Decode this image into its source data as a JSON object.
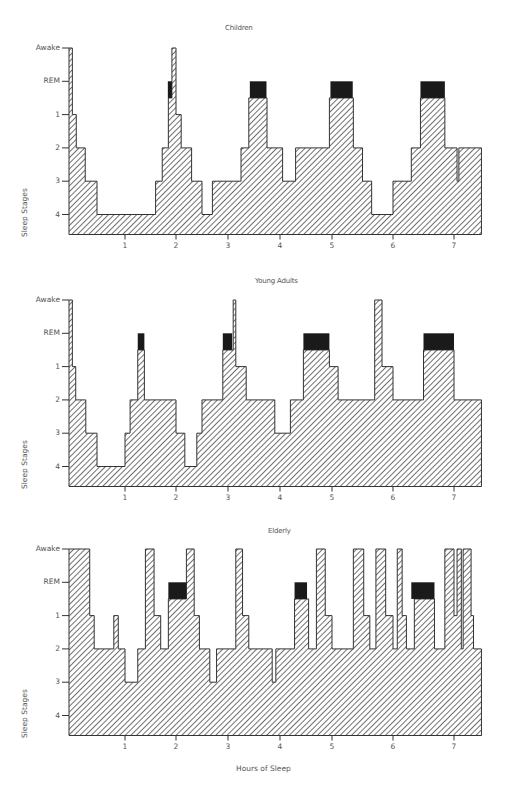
{
  "figure": {
    "xlabel": "Hours of Sleep",
    "ylabel": "Sleep Stages",
    "colors": {
      "hatch": "#333333",
      "rem_block": "#1a1a1a",
      "axis": "#333333",
      "text": "#555555"
    }
  },
  "chart_data": [
    {
      "type": "area",
      "title": "Children",
      "xlabel": "",
      "ylabel": "Sleep Stages",
      "y_tick_labels": [
        "Awake",
        "REM",
        "1",
        "2",
        "3",
        "4"
      ],
      "x_tick_labels": [
        "1",
        "2",
        "3",
        "4",
        "5",
        "6",
        "7"
      ],
      "xlim": [
        0,
        7.45
      ],
      "note": "Hypnogram step profile; level 0=Awake,1=REM,2=Stage1,3=Stage2,4=Stage3,5=Stage4. Black blocks mark REM periods.",
      "segments": [
        [
          0.0,
          0.06,
          0
        ],
        [
          0.06,
          0.13,
          2
        ],
        [
          0.13,
          0.29,
          3
        ],
        [
          0.29,
          0.5,
          4
        ],
        [
          0.5,
          1.6,
          5
        ],
        [
          1.6,
          1.73,
          4
        ],
        [
          1.73,
          1.85,
          3
        ],
        [
          1.85,
          1.92,
          1.5
        ],
        [
          1.92,
          2.0,
          0
        ],
        [
          2.0,
          2.1,
          2
        ],
        [
          2.1,
          2.3,
          3
        ],
        [
          2.3,
          2.5,
          4
        ],
        [
          2.5,
          2.7,
          5
        ],
        [
          2.7,
          3.25,
          4
        ],
        [
          3.25,
          3.4,
          3
        ],
        [
          3.4,
          3.75,
          1.5
        ],
        [
          3.75,
          4.05,
          3
        ],
        [
          4.05,
          4.3,
          4
        ],
        [
          4.3,
          4.95,
          3
        ],
        [
          4.95,
          5.35,
          1.5
        ],
        [
          5.35,
          5.5,
          3
        ],
        [
          5.5,
          5.65,
          4
        ],
        [
          5.65,
          6.0,
          5
        ],
        [
          6.0,
          6.3,
          4
        ],
        [
          6.3,
          6.45,
          3
        ],
        [
          6.45,
          6.85,
          1.5
        ],
        [
          6.85,
          7.05,
          3
        ],
        [
          7.05,
          7.08,
          4
        ],
        [
          7.08,
          7.45,
          3
        ]
      ],
      "rem_blocks": [
        [
          1.84,
          1.92
        ],
        [
          3.42,
          3.74
        ],
        [
          4.97,
          5.34
        ],
        [
          6.45,
          6.85
        ]
      ]
    },
    {
      "type": "area",
      "title": "Young Adults",
      "xlabel": "",
      "ylabel": "Sleep Stages",
      "y_tick_labels": [
        "Awake",
        "REM",
        "1",
        "2",
        "3",
        "4"
      ],
      "x_tick_labels": [
        "1",
        "2",
        "3",
        "4",
        "5",
        "6",
        "7"
      ],
      "xlim": [
        0,
        7.45
      ],
      "segments": [
        [
          0.0,
          0.06,
          0
        ],
        [
          0.06,
          0.12,
          2
        ],
        [
          0.12,
          0.3,
          3
        ],
        [
          0.3,
          0.5,
          4
        ],
        [
          0.5,
          1.0,
          5
        ],
        [
          1.0,
          1.1,
          4
        ],
        [
          1.1,
          1.25,
          3
        ],
        [
          1.25,
          1.38,
          1.5
        ],
        [
          1.38,
          2.0,
          3
        ],
        [
          2.0,
          2.17,
          4
        ],
        [
          2.17,
          2.4,
          5
        ],
        [
          2.4,
          2.5,
          4
        ],
        [
          2.5,
          2.9,
          3
        ],
        [
          2.9,
          3.1,
          1.5
        ],
        [
          3.1,
          3.15,
          0
        ],
        [
          3.15,
          3.35,
          2
        ],
        [
          3.35,
          3.5,
          3
        ],
        [
          3.5,
          3.9,
          3
        ],
        [
          3.9,
          4.2,
          4
        ],
        [
          4.2,
          4.45,
          3
        ],
        [
          4.45,
          4.95,
          1.5
        ],
        [
          4.95,
          5.1,
          2
        ],
        [
          5.1,
          5.7,
          3
        ],
        [
          5.7,
          5.82,
          0
        ],
        [
          5.82,
          6.0,
          2
        ],
        [
          6.0,
          6.5,
          3
        ],
        [
          6.5,
          7.0,
          1.5
        ],
        [
          7.0,
          7.45,
          3
        ]
      ],
      "rem_blocks": [
        [
          1.25,
          1.38
        ],
        [
          2.9,
          3.08
        ],
        [
          4.45,
          4.95
        ],
        [
          6.5,
          7.0
        ]
      ]
    },
    {
      "type": "area",
      "title": "Elderly",
      "xlabel": "Hours of Sleep",
      "ylabel": "Sleep Stages",
      "y_tick_labels": [
        "Awake",
        "REM",
        "1",
        "2",
        "3",
        "4"
      ],
      "x_tick_labels": [
        "1",
        "2",
        "3",
        "4",
        "5",
        "6",
        "7"
      ],
      "xlim": [
        0,
        7.45
      ],
      "segments": [
        [
          0.0,
          0.37,
          0
        ],
        [
          0.37,
          0.45,
          2
        ],
        [
          0.45,
          0.8,
          3
        ],
        [
          0.8,
          0.88,
          2
        ],
        [
          0.88,
          1.0,
          3
        ],
        [
          1.0,
          1.25,
          4
        ],
        [
          1.25,
          1.4,
          3
        ],
        [
          1.4,
          1.57,
          0
        ],
        [
          1.57,
          1.7,
          2
        ],
        [
          1.7,
          1.85,
          3
        ],
        [
          1.85,
          2.2,
          1.5
        ],
        [
          2.2,
          2.35,
          0
        ],
        [
          2.35,
          2.45,
          2
        ],
        [
          2.45,
          2.65,
          3
        ],
        [
          2.65,
          2.78,
          4
        ],
        [
          2.78,
          3.15,
          3
        ],
        [
          3.15,
          3.28,
          0
        ],
        [
          3.28,
          3.4,
          2
        ],
        [
          3.4,
          3.85,
          3
        ],
        [
          3.85,
          3.92,
          4
        ],
        [
          3.92,
          4.28,
          3
        ],
        [
          4.28,
          4.55,
          1.5
        ],
        [
          4.55,
          4.7,
          3
        ],
        [
          4.7,
          4.87,
          0
        ],
        [
          4.87,
          5.0,
          2
        ],
        [
          5.0,
          5.35,
          3
        ],
        [
          5.35,
          5.52,
          0
        ],
        [
          5.52,
          5.62,
          2
        ],
        [
          5.62,
          5.72,
          3
        ],
        [
          5.72,
          5.88,
          0
        ],
        [
          5.88,
          6.0,
          2
        ],
        [
          6.0,
          6.07,
          3
        ],
        [
          6.07,
          6.15,
          0
        ],
        [
          6.15,
          6.22,
          2
        ],
        [
          6.22,
          6.35,
          3
        ],
        [
          6.35,
          6.68,
          1.5
        ],
        [
          6.68,
          6.85,
          3
        ],
        [
          6.85,
          7.0,
          0
        ],
        [
          7.0,
          7.05,
          2
        ],
        [
          7.05,
          7.12,
          0
        ],
        [
          7.12,
          7.15,
          3
        ],
        [
          7.15,
          7.28,
          0
        ],
        [
          7.28,
          7.32,
          2
        ],
        [
          7.32,
          7.45,
          3
        ]
      ],
      "rem_blocks": [
        [
          1.85,
          2.2
        ],
        [
          4.28,
          4.52
        ],
        [
          6.3,
          6.68
        ]
      ]
    }
  ]
}
